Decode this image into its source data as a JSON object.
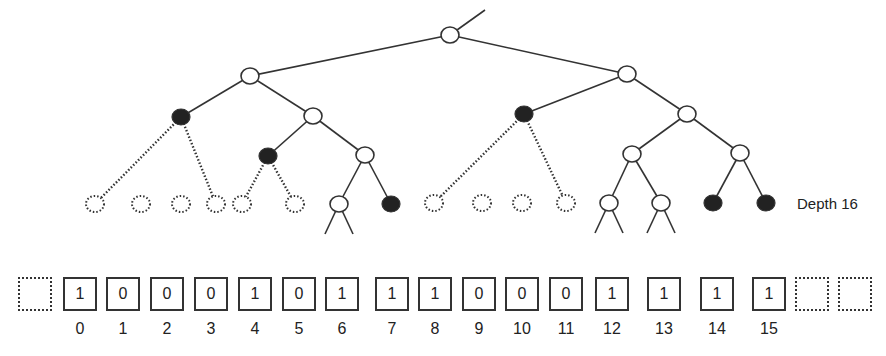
{
  "depth_label": "Depth 16",
  "colors": {
    "stroke": "#333333",
    "filled_node": "#222222",
    "open_node": "#ffffff",
    "background": "#ffffff"
  },
  "tree": {
    "incoming_edge": {
      "from": [
        485,
        10
      ],
      "to": [
        450,
        35
      ]
    },
    "nodes": [
      {
        "id": "root",
        "x": 450,
        "y": 35,
        "type": "open"
      },
      {
        "id": "a",
        "x": 250,
        "y": 76,
        "type": "open"
      },
      {
        "id": "b",
        "x": 627,
        "y": 74,
        "type": "open"
      },
      {
        "id": "aa",
        "x": 181,
        "y": 117,
        "type": "filled"
      },
      {
        "id": "ab",
        "x": 313,
        "y": 116,
        "type": "open"
      },
      {
        "id": "ba",
        "x": 524,
        "y": 114,
        "type": "filled"
      },
      {
        "id": "bb",
        "x": 687,
        "y": 114,
        "type": "open"
      },
      {
        "id": "aba",
        "x": 268,
        "y": 156,
        "type": "filled"
      },
      {
        "id": "abb",
        "x": 365,
        "y": 155,
        "type": "open"
      },
      {
        "id": "bba",
        "x": 632,
        "y": 154,
        "type": "open"
      },
      {
        "id": "bbb",
        "x": 740,
        "y": 153,
        "type": "open"
      },
      {
        "id": "l0",
        "x": 95,
        "y": 204,
        "type": "dashed"
      },
      {
        "id": "l1",
        "x": 141,
        "y": 204,
        "type": "dashed"
      },
      {
        "id": "l2",
        "x": 181,
        "y": 204,
        "type": "dashed"
      },
      {
        "id": "l3",
        "x": 216,
        "y": 204,
        "type": "dashed"
      },
      {
        "id": "l4",
        "x": 242,
        "y": 204,
        "type": "dashed"
      },
      {
        "id": "l5",
        "x": 295,
        "y": 204,
        "type": "dashed"
      },
      {
        "id": "l6",
        "x": 339,
        "y": 204,
        "type": "open"
      },
      {
        "id": "l7",
        "x": 391,
        "y": 204,
        "type": "filled"
      },
      {
        "id": "l8",
        "x": 434,
        "y": 203,
        "type": "dashed"
      },
      {
        "id": "l9",
        "x": 482,
        "y": 203,
        "type": "dashed"
      },
      {
        "id": "l10",
        "x": 522,
        "y": 203,
        "type": "dashed"
      },
      {
        "id": "l11",
        "x": 566,
        "y": 203,
        "type": "dashed"
      },
      {
        "id": "l12",
        "x": 609,
        "y": 203,
        "type": "open"
      },
      {
        "id": "l13",
        "x": 661,
        "y": 203,
        "type": "open"
      },
      {
        "id": "l14",
        "x": 713,
        "y": 203,
        "type": "filled"
      },
      {
        "id": "l15",
        "x": 766,
        "y": 203,
        "type": "filled"
      }
    ],
    "edges": [
      {
        "from": "root",
        "to": "a",
        "style": "solid"
      },
      {
        "from": "root",
        "to": "b",
        "style": "solid"
      },
      {
        "from": "a",
        "to": "aa",
        "style": "solid"
      },
      {
        "from": "a",
        "to": "ab",
        "style": "solid"
      },
      {
        "from": "b",
        "to": "ba",
        "style": "solid"
      },
      {
        "from": "b",
        "to": "bb",
        "style": "solid"
      },
      {
        "from": "aa",
        "to": "l0",
        "style": "dotted"
      },
      {
        "from": "aa",
        "to": "l3",
        "style": "dotted"
      },
      {
        "from": "ab",
        "to": "aba",
        "style": "solid"
      },
      {
        "from": "ab",
        "to": "abb",
        "style": "solid"
      },
      {
        "from": "aba",
        "to": "l4",
        "style": "dotted"
      },
      {
        "from": "aba",
        "to": "l5",
        "style": "dotted"
      },
      {
        "from": "abb",
        "to": "l6",
        "style": "solid"
      },
      {
        "from": "abb",
        "to": "l7",
        "style": "solid"
      },
      {
        "from": "ba",
        "to": "l8",
        "style": "dotted"
      },
      {
        "from": "ba",
        "to": "l11",
        "style": "dotted"
      },
      {
        "from": "bb",
        "to": "bba",
        "style": "solid"
      },
      {
        "from": "bb",
        "to": "bbb",
        "style": "solid"
      },
      {
        "from": "bba",
        "to": "l12",
        "style": "solid"
      },
      {
        "from": "bba",
        "to": "l13",
        "style": "solid"
      },
      {
        "from": "bbb",
        "to": "l14",
        "style": "solid"
      },
      {
        "from": "bbb",
        "to": "l15",
        "style": "solid"
      }
    ],
    "stubs": [
      {
        "node": "l6",
        "dx": [
          -14,
          14
        ],
        "dy": 30
      },
      {
        "node": "l12",
        "dx": [
          -14,
          14
        ],
        "dy": 30
      },
      {
        "node": "l13",
        "dx": [
          -14,
          14
        ],
        "dy": 30
      }
    ]
  },
  "array": {
    "cells": [
      {
        "x": 18,
        "value": "",
        "index": "",
        "empty": true
      },
      {
        "x": 63,
        "value": "1",
        "index": "0",
        "empty": false
      },
      {
        "x": 106,
        "value": "0",
        "index": "1",
        "empty": false
      },
      {
        "x": 150,
        "value": "0",
        "index": "2",
        "empty": false
      },
      {
        "x": 194,
        "value": "0",
        "index": "3",
        "empty": false
      },
      {
        "x": 238,
        "value": "1",
        "index": "4",
        "empty": false
      },
      {
        "x": 282,
        "value": "0",
        "index": "5",
        "empty": false
      },
      {
        "x": 325,
        "value": "1",
        "index": "6",
        "empty": false
      },
      {
        "x": 375,
        "value": "1",
        "index": "7",
        "empty": false
      },
      {
        "x": 418,
        "value": "1",
        "index": "8",
        "empty": false
      },
      {
        "x": 462,
        "value": "0",
        "index": "9",
        "empty": false
      },
      {
        "x": 505,
        "value": "0",
        "index": "10",
        "empty": false
      },
      {
        "x": 549,
        "value": "0",
        "index": "11",
        "empty": false
      },
      {
        "x": 595,
        "value": "1",
        "index": "12",
        "empty": false
      },
      {
        "x": 647,
        "value": "1",
        "index": "13",
        "empty": false
      },
      {
        "x": 700,
        "value": "1",
        "index": "14",
        "empty": false
      },
      {
        "x": 752,
        "value": "1",
        "index": "15",
        "empty": false
      },
      {
        "x": 795,
        "value": "",
        "index": "",
        "empty": true
      },
      {
        "x": 838,
        "value": "",
        "index": "",
        "empty": true
      }
    ]
  }
}
